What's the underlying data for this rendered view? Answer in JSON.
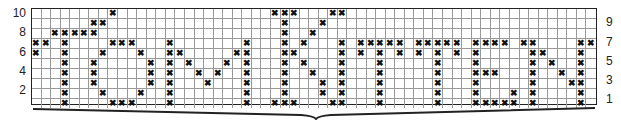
{
  "chart": {
    "columns": 59,
    "rows": 10,
    "mark_symbol": "✖",
    "left_row_labels": [
      "10",
      "8",
      "6",
      "4",
      "2"
    ],
    "right_row_labels": [
      "9",
      "7",
      "5",
      "3",
      "1"
    ],
    "marks_by_row": {
      "10": [
        8,
        25,
        26,
        27,
        31,
        32
      ],
      "9": [
        6,
        7,
        26,
        30
      ],
      "8": [
        2,
        3,
        4,
        5,
        6,
        26,
        29
      ],
      "7": [
        0,
        1,
        3,
        8,
        9,
        10,
        14,
        22,
        26,
        28,
        32,
        34,
        35,
        36,
        37,
        38,
        40,
        41,
        42,
        43,
        44,
        46,
        47,
        48,
        49,
        51,
        52,
        57,
        58
      ],
      "6": [
        0,
        3,
        7,
        11,
        14,
        15,
        21,
        22,
        26,
        27,
        32,
        34,
        36,
        38,
        40,
        42,
        44,
        46,
        52,
        53,
        57
      ],
      "5": [
        3,
        6,
        12,
        14,
        16,
        20,
        22,
        26,
        28,
        32,
        36,
        42,
        46,
        52,
        54,
        57
      ],
      "4": [
        3,
        6,
        12,
        14,
        17,
        19,
        22,
        26,
        29,
        32,
        36,
        42,
        46,
        47,
        48,
        52,
        55,
        57
      ],
      "3": [
        3,
        6,
        12,
        14,
        18,
        22,
        26,
        30,
        32,
        36,
        42,
        46,
        52,
        56,
        57
      ],
      "2": [
        3,
        7,
        11,
        14,
        22,
        26,
        30,
        32,
        36,
        42,
        46,
        50,
        52,
        57
      ],
      "1": [
        3,
        8,
        9,
        10,
        14,
        22,
        25,
        26,
        27,
        31,
        32,
        36,
        42,
        46,
        47,
        48,
        49,
        50,
        52,
        57
      ]
    }
  },
  "colors": {
    "grid_line": "#999999",
    "border": "#222222",
    "mark": "#111111",
    "brace": "#222222"
  }
}
